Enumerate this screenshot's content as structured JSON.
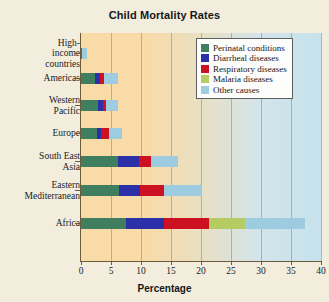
{
  "chart_data": {
    "type": "bar",
    "orientation": "horizontal",
    "stacked": true,
    "title": "Child Mortality Rates",
    "xlabel": "Percentage",
    "ylabel": "",
    "xlim": [
      0,
      40
    ],
    "xticks": [
      0,
      5,
      10,
      15,
      20,
      25,
      30,
      35,
      40
    ],
    "grid": "vertical",
    "legend_position": "top-right",
    "categories": [
      "High-income countries",
      "Americas",
      "Western Pacific",
      "Europe",
      "South East Asia",
      "Eastern Mediterranean",
      "Africa"
    ],
    "series": [
      {
        "name": "Perinatal conditions",
        "color": "#3f7e5e",
        "values": [
          0.2,
          2.4,
          2.8,
          2.6,
          6.2,
          6.3,
          7.5
        ]
      },
      {
        "name": "Diarrheal diseases",
        "color": "#2b2fa8",
        "values": [
          0.0,
          0.7,
          0.9,
          0.8,
          3.5,
          3.5,
          6.3
        ]
      },
      {
        "name": "Respiratory diseases",
        "color": "#cc1122",
        "values": [
          0.0,
          0.8,
          0.5,
          1.3,
          2.0,
          4.1,
          7.6
        ]
      },
      {
        "name": "Malaria diseases",
        "color": "#b5cc63",
        "values": [
          0.0,
          0.0,
          0.0,
          0.0,
          0.0,
          0.0,
          5.9
        ]
      },
      {
        "name": "Other causes",
        "color": "#9dcbdf",
        "values": [
          0.8,
          2.2,
          1.9,
          2.1,
          4.5,
          6.2,
          10.0
        ]
      }
    ],
    "totals": [
      1.0,
      6.1,
      6.1,
      6.8,
      16.2,
      20.1,
      37.3
    ]
  },
  "legend": {
    "items": [
      {
        "label": "Perinatal conditions"
      },
      {
        "label": "Diarrheal diseases"
      },
      {
        "label": "Respiratory diseases"
      },
      {
        "label": "Malaria diseases"
      },
      {
        "label": "Other causes"
      }
    ]
  },
  "axes": {
    "x_title": "Percentage",
    "x_tick_labels": [
      "0",
      "5",
      "10",
      "15",
      "20",
      "25",
      "30",
      "35",
      "40"
    ],
    "y_tick_labels": [
      "High-\nincome\ncountries",
      "Americas",
      "Western\nPacific",
      "Europe",
      "South East\nAsia",
      "Eastern\nMediterranean",
      "Africa"
    ]
  }
}
